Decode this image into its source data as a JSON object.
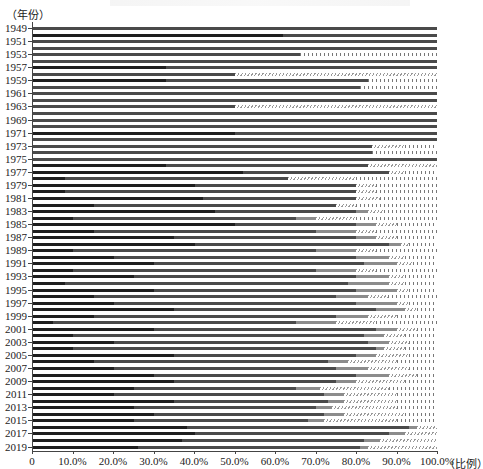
{
  "chart_data": {
    "type": "bar",
    "orientation": "horizontal",
    "stacked": true,
    "title": "",
    "ylabel": "（年份）",
    "xlabel": "（比例）",
    "xlim": [
      0,
      1.0
    ],
    "x_ticks": [
      "0",
      "10.0%",
      "20.0%",
      "30.0%",
      "40.0%",
      "50.0%",
      "60.0%",
      "70.0%",
      "80.0%",
      "90.0%",
      "100.0%"
    ],
    "y_tick_labels": [
      "1949",
      "1951",
      "1953",
      "1957",
      "1959",
      "1961",
      "1963",
      "1969",
      "1971",
      "1973",
      "1975",
      "1977",
      "1979",
      "1981",
      "1983",
      "1985",
      "1987",
      "1989",
      "1991",
      "1993",
      "1995",
      "1997",
      "1999",
      "2001",
      "2003",
      "2005",
      "2007",
      "2009",
      "2011",
      "2013",
      "2015",
      "2017",
      "2019"
    ],
    "grid": false,
    "legend": "none visible",
    "segment_styles": [
      "black",
      "dark-gray",
      "gray",
      "diagonal-hatch",
      "vertical-dash"
    ],
    "series_note": "Each bar is a stacked composition summing to 100%; values estimated from pixels, listed as [black, dark-gray, gray, diagonal-hatch, vertical-dash] fractions.",
    "bars": [
      [
        0.0,
        1.0,
        0,
        0,
        0
      ],
      [
        0.62,
        0.38,
        0,
        0,
        0
      ],
      [
        0,
        1.0,
        0,
        0,
        0
      ],
      [
        0,
        1.0,
        0,
        0,
        0
      ],
      [
        0,
        0.66,
        0,
        0,
        0.34
      ],
      [
        0,
        1.0,
        0,
        0,
        0
      ],
      [
        0.33,
        0.67,
        0,
        0,
        0
      ],
      [
        0,
        0.5,
        0,
        0.5,
        0
      ],
      [
        0.33,
        0.5,
        0,
        0,
        0.17
      ],
      [
        0,
        0.81,
        0,
        0,
        0.19
      ],
      [
        0,
        1.0,
        0,
        0,
        0
      ],
      [
        0,
        1.0,
        0,
        0,
        0
      ],
      [
        0,
        0.5,
        0,
        0.5,
        0
      ],
      [
        0,
        1.0,
        0,
        0,
        0
      ],
      [
        0,
        1.0,
        0,
        0,
        0
      ],
      [
        0,
        1.0,
        0,
        0,
        0
      ],
      [
        0.5,
        0.5,
        0,
        0,
        0
      ],
      [
        0.0,
        1.0,
        0,
        0,
        0
      ],
      [
        0,
        0.84,
        0,
        0.08,
        0.08
      ],
      [
        0,
        0.84,
        0,
        0,
        0.16
      ],
      [
        0,
        1.0,
        0,
        0,
        0
      ],
      [
        0.33,
        0.5,
        0,
        0.17,
        0
      ],
      [
        0.52,
        0.36,
        0,
        0.04,
        0.08
      ],
      [
        0.08,
        0.55,
        0,
        0.17,
        0.2
      ],
      [
        0.4,
        0.4,
        0,
        0.05,
        0.15
      ],
      [
        0.08,
        0.72,
        0,
        0.05,
        0.15
      ],
      [
        0.42,
        0.38,
        0,
        0.06,
        0.14
      ],
      [
        0.15,
        0.6,
        0,
        0.05,
        0.2
      ],
      [
        0.45,
        0.35,
        0.03,
        0.04,
        0.13
      ],
      [
        0.1,
        0.55,
        0.05,
        0.1,
        0.2
      ],
      [
        0.5,
        0.3,
        0.05,
        0.05,
        0.1
      ],
      [
        0.15,
        0.55,
        0.1,
        0.05,
        0.15
      ],
      [
        0.35,
        0.45,
        0.05,
        0.05,
        0.1
      ],
      [
        0.4,
        0.48,
        0.03,
        0.02,
        0.07
      ],
      [
        0.1,
        0.6,
        0.1,
        0.05,
        0.15
      ],
      [
        0.2,
        0.6,
        0.08,
        0.04,
        0.08
      ],
      [
        0.3,
        0.52,
        0.08,
        0.04,
        0.06
      ],
      [
        0.1,
        0.6,
        0.1,
        0.05,
        0.15
      ],
      [
        0.25,
        0.55,
        0.08,
        0.04,
        0.08
      ],
      [
        0.08,
        0.7,
        0.1,
        0.04,
        0.08
      ],
      [
        0.3,
        0.5,
        0.1,
        0.03,
        0.07
      ],
      [
        0.15,
        0.6,
        0.08,
        0.05,
        0.12
      ],
      [
        0.2,
        0.6,
        0.1,
        0.03,
        0.07
      ],
      [
        0.35,
        0.5,
        0.07,
        0.03,
        0.05
      ],
      [
        0.15,
        0.6,
        0.08,
        0.07,
        0.1
      ],
      [
        0.05,
        0.6,
        0.1,
        0.1,
        0.15
      ],
      [
        0.3,
        0.55,
        0.05,
        0.05,
        0.05
      ],
      [
        0.1,
        0.72,
        0.05,
        0.05,
        0.08
      ],
      [
        0.2,
        0.63,
        0.05,
        0.05,
        0.07
      ],
      [
        0.1,
        0.75,
        0.02,
        0.05,
        0.08
      ],
      [
        0.35,
        0.45,
        0.05,
        0.08,
        0.07
      ],
      [
        0.15,
        0.58,
        0.05,
        0.12,
        0.1
      ],
      [
        0.2,
        0.55,
        0.08,
        0.1,
        0.07
      ],
      [
        0.3,
        0.5,
        0.08,
        0.07,
        0.05
      ],
      [
        0.35,
        0.4,
        0.05,
        0.12,
        0.08
      ],
      [
        0.25,
        0.4,
        0.06,
        0.17,
        0.12
      ],
      [
        0.2,
        0.52,
        0.05,
        0.13,
        0.1
      ],
      [
        0.35,
        0.38,
        0.04,
        0.13,
        0.1
      ],
      [
        0.25,
        0.45,
        0.04,
        0.16,
        0.1
      ],
      [
        0.3,
        0.42,
        0.05,
        0.15,
        0.08
      ],
      [
        0.25,
        0.43,
        0.04,
        0.18,
        0.1
      ],
      [
        0.38,
        0.55,
        0.02,
        0.05,
        0.0
      ],
      [
        0.4,
        0.48,
        0.04,
        0.08,
        0.0
      ],
      [
        0.37,
        0.45,
        0.04,
        0.14,
        0.0
      ],
      [
        0.26,
        0.55,
        0.02,
        0.17,
        0.0
      ]
    ]
  },
  "labels": {
    "y_unit": "（年份）",
    "x_unit": "（比例）"
  }
}
